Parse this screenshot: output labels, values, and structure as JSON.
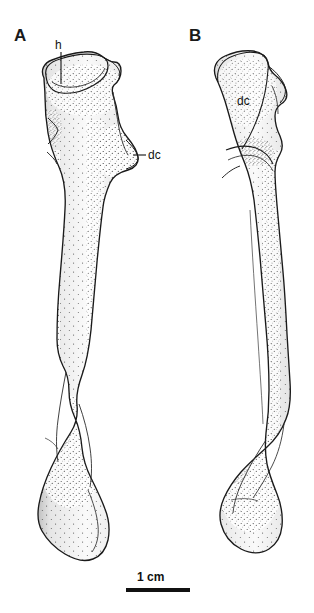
{
  "figure": {
    "background_color": "#ffffff",
    "line_color": "#1a1a1a",
    "fill_color": "#ffffff",
    "width": 314,
    "height": 613
  },
  "panels": [
    {
      "letter": "A",
      "view": "anterior",
      "annotations": [
        {
          "id": "h",
          "label": "h",
          "meaning": "head",
          "has_leader_line": true
        },
        {
          "id": "dc-a",
          "label": "dc",
          "meaning": "deltopectoral crest",
          "has_leader_line": true
        }
      ]
    },
    {
      "letter": "B",
      "view": "posterior",
      "annotations": [
        {
          "id": "dc-b",
          "label": "dc",
          "meaning": "deltopectoral crest",
          "has_leader_line": false
        }
      ]
    }
  ],
  "scale": {
    "label": "1 cm",
    "bar_length_px": 64
  }
}
